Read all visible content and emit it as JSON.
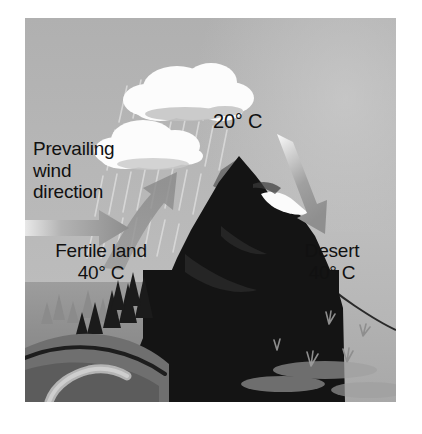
{
  "diagram": {
    "background_color": "#ffffff",
    "frame_color": "#b4b4b4",
    "labels": {
      "prevailing_wind": "Prevailing\nwind\ndirection",
      "fertile_land": "Fertile land\n40° C",
      "desert": "Desert\n40° C",
      "peak_temperature": "20° C"
    },
    "temperatures": {
      "windward_base": "40° C",
      "summit": "20° C",
      "leeward_base": "40° C"
    },
    "elements": {
      "cloud_upper": "rain-cloud",
      "cloud_lower": "rain-cloud",
      "rain": "rain-streaks",
      "wind_arrow_horizontal": "arrow-right",
      "wind_arrow_up_slope": "arrow-up-curved",
      "wind_arrow_down_slope": "arrow-down-right",
      "mountain": "mountain-silhouette",
      "snow_patch": "snow-cap",
      "forest": "conifer-trees",
      "river": "winding-river",
      "desert_plants": "desert-grass-tufts"
    },
    "colors": {
      "sky": "#b5b5b5",
      "cloud": "#fdfdfd",
      "mountain_dark": "#151515",
      "mountain_face": "#6e6e6e",
      "arrow": "#9a9a9a",
      "ground_fertile": "#8c8c8c",
      "ground_desert": "#b6b6b6",
      "text": "#111111"
    }
  }
}
